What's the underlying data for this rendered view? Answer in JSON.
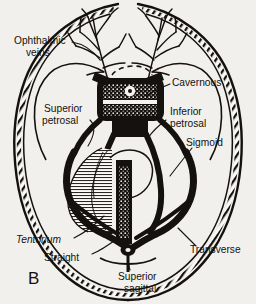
{
  "figure": {
    "panel_label": "B",
    "caption_present": false,
    "background_color": "#f2f0ec",
    "ink_color": "#14110f",
    "view": "superior view of dural venous sinuses at skull base"
  },
  "labels": [
    {
      "id": "ophthalmic-veins",
      "text_line1": "Ophthalmic",
      "text_line2": "veins",
      "style": "regular",
      "x": 14,
      "y": 44,
      "anchor": "start"
    },
    {
      "id": "cavernous",
      "text_line1": "Cavernous",
      "text_line2": "",
      "style": "regular",
      "x": 172,
      "y": 86,
      "anchor": "start"
    },
    {
      "id": "superior-petrosal",
      "text_line1": "Superior",
      "text_line2": "petrosal",
      "style": "regular",
      "x": 44,
      "y": 112,
      "anchor": "start"
    },
    {
      "id": "inferior-petrosal",
      "text_line1": "Inferior",
      "text_line2": "petrosal",
      "style": "regular",
      "x": 168,
      "y": 115,
      "anchor": "start"
    },
    {
      "id": "sigmoid",
      "text_line1": "Sigmoid",
      "text_line2": "",
      "style": "regular",
      "x": 186,
      "y": 143,
      "anchor": "start"
    },
    {
      "id": "tentorium",
      "text_line1": "Tentorium",
      "text_line2": "",
      "style": "italic",
      "x": 16,
      "y": 243,
      "anchor": "start"
    },
    {
      "id": "straight",
      "text_line1": "Straight",
      "text_line2": "",
      "style": "regular",
      "x": 44,
      "y": 260,
      "anchor": "start"
    },
    {
      "id": "transverse",
      "text_line1": "Transverse",
      "text_line2": "",
      "style": "regular",
      "x": 190,
      "y": 251,
      "anchor": "start"
    },
    {
      "id": "superior-sagittal",
      "text_line1": "Superior",
      "text_line2": "sagittal",
      "style": "regular",
      "x": 118,
      "y": 277,
      "anchor": "start"
    }
  ],
  "structures": [
    {
      "id": "skull-dura-border",
      "name": "skull and dura outer border",
      "texture": "double line with diagonal hatching"
    },
    {
      "id": "cavernous-sinus",
      "name": "cavernous sinus",
      "texture": "stippled box with central circle"
    },
    {
      "id": "sella-outline",
      "name": "sella / pituitary outline",
      "texture": "dashed arc"
    },
    {
      "id": "superior-petrosal-sinus",
      "name": "superior petrosal sinus",
      "texture": "solid black band"
    },
    {
      "id": "inferior-petrosal-sinus",
      "name": "inferior petrosal sinus",
      "texture": "solid black band"
    },
    {
      "id": "sigmoid-sinus",
      "name": "sigmoid sinus",
      "texture": "thick black S curve"
    },
    {
      "id": "transverse-sinus",
      "name": "transverse sinus",
      "texture": "thick black horizontal band"
    },
    {
      "id": "tentorium-cerebelli",
      "name": "tentorium cerebelli",
      "texture": "fine striated fan"
    },
    {
      "id": "straight-sinus",
      "name": "straight sinus",
      "texture": "stippled vertical band"
    },
    {
      "id": "superior-sagittal-sinus",
      "name": "superior sagittal sinus",
      "texture": "midline band to confluence"
    },
    {
      "id": "confluence-of-sinuses",
      "name": "confluence of sinuses",
      "texture": "dark node"
    },
    {
      "id": "ophthalmic-vein-tree-left",
      "name": "left ophthalmic vein branching tree",
      "texture": "dendritic lines"
    },
    {
      "id": "ophthalmic-vein-tree-right",
      "name": "right ophthalmic vein branching tree",
      "texture": "dendritic lines"
    }
  ]
}
